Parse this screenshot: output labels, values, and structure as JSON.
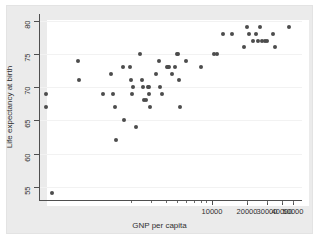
{
  "chart_data": {
    "type": "scatter",
    "title": "",
    "xlabel": "GNP per capita",
    "ylabel": "Life expectancy at birth",
    "x_scale": "log",
    "y_scale": "linear",
    "xlim": [
      330,
      60000
    ],
    "ylim": [
      53,
      81
    ],
    "grid": "horizontal",
    "legend": "none",
    "x_ticks": [
      {
        "value": 10000,
        "label": "10000"
      },
      {
        "value": 20000,
        "label": "20000"
      },
      {
        "value": 30000,
        "label": "30000"
      },
      {
        "value": 40000,
        "label": "40000"
      },
      {
        "value": 50000,
        "label": "50000"
      }
    ],
    "y_ticks": [
      {
        "value": 55,
        "label": "55"
      },
      {
        "value": 60,
        "label": "60"
      },
      {
        "value": 65,
        "label": "65"
      },
      {
        "value": 70,
        "label": "70"
      },
      {
        "value": 75,
        "label": "75"
      },
      {
        "value": 80,
        "label": "80"
      }
    ],
    "marker_color": "#4c4c4c",
    "marker_size": 4,
    "points": [
      {
        "x": 370,
        "y": 69
      },
      {
        "x": 370,
        "y": 67
      },
      {
        "x": 420,
        "y": 54
      },
      {
        "x": 700,
        "y": 74
      },
      {
        "x": 720,
        "y": 71
      },
      {
        "x": 1150,
        "y": 69
      },
      {
        "x": 1350,
        "y": 72
      },
      {
        "x": 1400,
        "y": 69
      },
      {
        "x": 1450,
        "y": 67
      },
      {
        "x": 1500,
        "y": 62
      },
      {
        "x": 1700,
        "y": 73
      },
      {
        "x": 1750,
        "y": 65
      },
      {
        "x": 1950,
        "y": 73
      },
      {
        "x": 2000,
        "y": 71
      },
      {
        "x": 2050,
        "y": 69
      },
      {
        "x": 2100,
        "y": 70
      },
      {
        "x": 2200,
        "y": 64
      },
      {
        "x": 2400,
        "y": 75
      },
      {
        "x": 2500,
        "y": 71
      },
      {
        "x": 2550,
        "y": 70
      },
      {
        "x": 2600,
        "y": 68
      },
      {
        "x": 2700,
        "y": 68
      },
      {
        "x": 2800,
        "y": 70
      },
      {
        "x": 2850,
        "y": 70
      },
      {
        "x": 2900,
        "y": 69
      },
      {
        "x": 2950,
        "y": 67
      },
      {
        "x": 3300,
        "y": 72
      },
      {
        "x": 3500,
        "y": 74
      },
      {
        "x": 3600,
        "y": 70
      },
      {
        "x": 3700,
        "y": 69
      },
      {
        "x": 4100,
        "y": 73
      },
      {
        "x": 4200,
        "y": 73
      },
      {
        "x": 4300,
        "y": 73
      },
      {
        "x": 4500,
        "y": 72
      },
      {
        "x": 4800,
        "y": 73
      },
      {
        "x": 5000,
        "y": 75
      },
      {
        "x": 5100,
        "y": 75
      },
      {
        "x": 5200,
        "y": 71
      },
      {
        "x": 5300,
        "y": 67
      },
      {
        "x": 6000,
        "y": 74
      },
      {
        "x": 8000,
        "y": 73
      },
      {
        "x": 10500,
        "y": 75
      },
      {
        "x": 11000,
        "y": 75
      },
      {
        "x": 12500,
        "y": 78
      },
      {
        "x": 15000,
        "y": 78
      },
      {
        "x": 19000,
        "y": 76
      },
      {
        "x": 20000,
        "y": 79
      },
      {
        "x": 21000,
        "y": 78
      },
      {
        "x": 22500,
        "y": 77
      },
      {
        "x": 24000,
        "y": 78
      },
      {
        "x": 25000,
        "y": 77
      },
      {
        "x": 26000,
        "y": 79
      },
      {
        "x": 27000,
        "y": 77
      },
      {
        "x": 28500,
        "y": 77
      },
      {
        "x": 30000,
        "y": 77
      },
      {
        "x": 34000,
        "y": 78
      },
      {
        "x": 35000,
        "y": 76
      },
      {
        "x": 46000,
        "y": 79
      }
    ]
  }
}
